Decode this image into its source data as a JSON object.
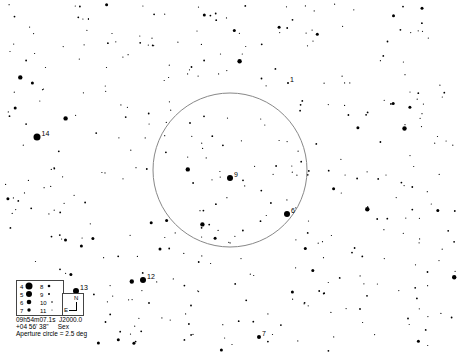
{
  "chart": {
    "type": "star-chart",
    "background": "#ffffff",
    "foreground": "#000000",
    "aperture_circle": {
      "cx": 230,
      "cy": 170,
      "r": 77,
      "color": "#888888"
    },
    "labeled_stars": [
      {
        "label": "1",
        "x": 288,
        "y": 83,
        "size": 1
      },
      {
        "label": "6",
        "x": 287,
        "y": 214,
        "size": 3
      },
      {
        "label": "7",
        "x": 259,
        "y": 337,
        "size": 2
      },
      {
        "label": "9",
        "x": 230,
        "y": 178,
        "size": 3
      },
      {
        "label": "12",
        "x": 143,
        "y": 280,
        "size": 3
      },
      {
        "label": "13",
        "x": 76,
        "y": 291,
        "size": 3
      },
      {
        "label": "14",
        "x": 37,
        "y": 137,
        "size": 3.5
      }
    ]
  },
  "legend": {
    "magnitudes": [
      {
        "mag": "4",
        "r": 3.5
      },
      {
        "mag": "5",
        "r": 3
      },
      {
        "mag": "6",
        "r": 2.3
      },
      {
        "mag": "7",
        "r": 1.7
      },
      {
        "mag": "8",
        "r": 1.3
      },
      {
        "mag": "9",
        "r": 1
      },
      {
        "mag": "10",
        "r": 0.8
      },
      {
        "mag": "11",
        "r": 0.5
      }
    ],
    "north_label": "N",
    "east_label": "E"
  },
  "info": {
    "ra": "09h54m07.1s",
    "epoch": "J2000.0",
    "dec": "+04 56' 38\"",
    "constellation": "Sex",
    "aperture": "Aperture circle = 2.5 deg"
  }
}
